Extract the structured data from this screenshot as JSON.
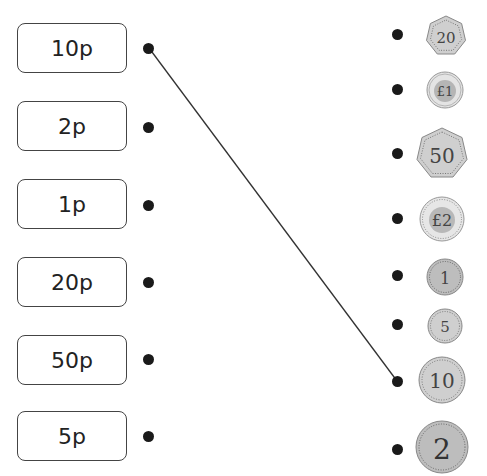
{
  "labels": [
    {
      "text": "10p"
    },
    {
      "text": "2p"
    },
    {
      "text": "1p"
    },
    {
      "text": "20p"
    },
    {
      "text": "50p"
    },
    {
      "text": "5p"
    }
  ],
  "coins": [
    {
      "value": "20",
      "rim_text": "TWENTY PENCE",
      "shape": "heptagon",
      "size": 40
    },
    {
      "value": "£1",
      "rim_text": "ONE POUND",
      "shape": "bimetal",
      "size": 36
    },
    {
      "value": "50",
      "rim_text": "FIFTY PENCE",
      "shape": "heptagon",
      "size": 50
    },
    {
      "value": "£2",
      "rim_text": "TWO POUNDS",
      "shape": "bimetal",
      "size": 44
    },
    {
      "value": "1",
      "rim_text": "ONE PENNY",
      "shape": "circle",
      "size": 36
    },
    {
      "value": "5",
      "rim_text": "FIVE PENCE",
      "shape": "circle",
      "size": 34
    },
    {
      "value": "10",
      "rim_text": "TEN PENCE",
      "shape": "circle",
      "size": 46
    },
    {
      "value": "2",
      "rim_text": "TWO PENCE",
      "shape": "circle",
      "size": 52
    }
  ],
  "connections": [
    {
      "from_label": "10p",
      "to_coin": "10"
    }
  ],
  "colors": {
    "coin_silver": "#c9c9c9",
    "coin_copper": "#bdbdbd",
    "coin_inner": "#a9a9a9",
    "ink": "#1a1a1a"
  }
}
